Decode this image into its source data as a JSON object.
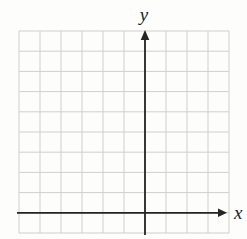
{
  "chart_data": {
    "type": "scatter",
    "title": "",
    "xlabel": "x",
    "ylabel": "y",
    "series": [],
    "tick_labels": [],
    "grid": true,
    "grid_columns": 10,
    "grid_rows": 10,
    "origin": {
      "grid_column_of_y_axis": 6,
      "grid_row_of_x_axis": 9
    },
    "axis_range_cells": {
      "x": [
        -6,
        4
      ],
      "y": [
        -1,
        9
      ]
    },
    "colors": {
      "background": "#fdfdfc",
      "grid_line": "#cfcfcf",
      "axis_line": "#242424",
      "label": "#1c1c1c"
    }
  }
}
